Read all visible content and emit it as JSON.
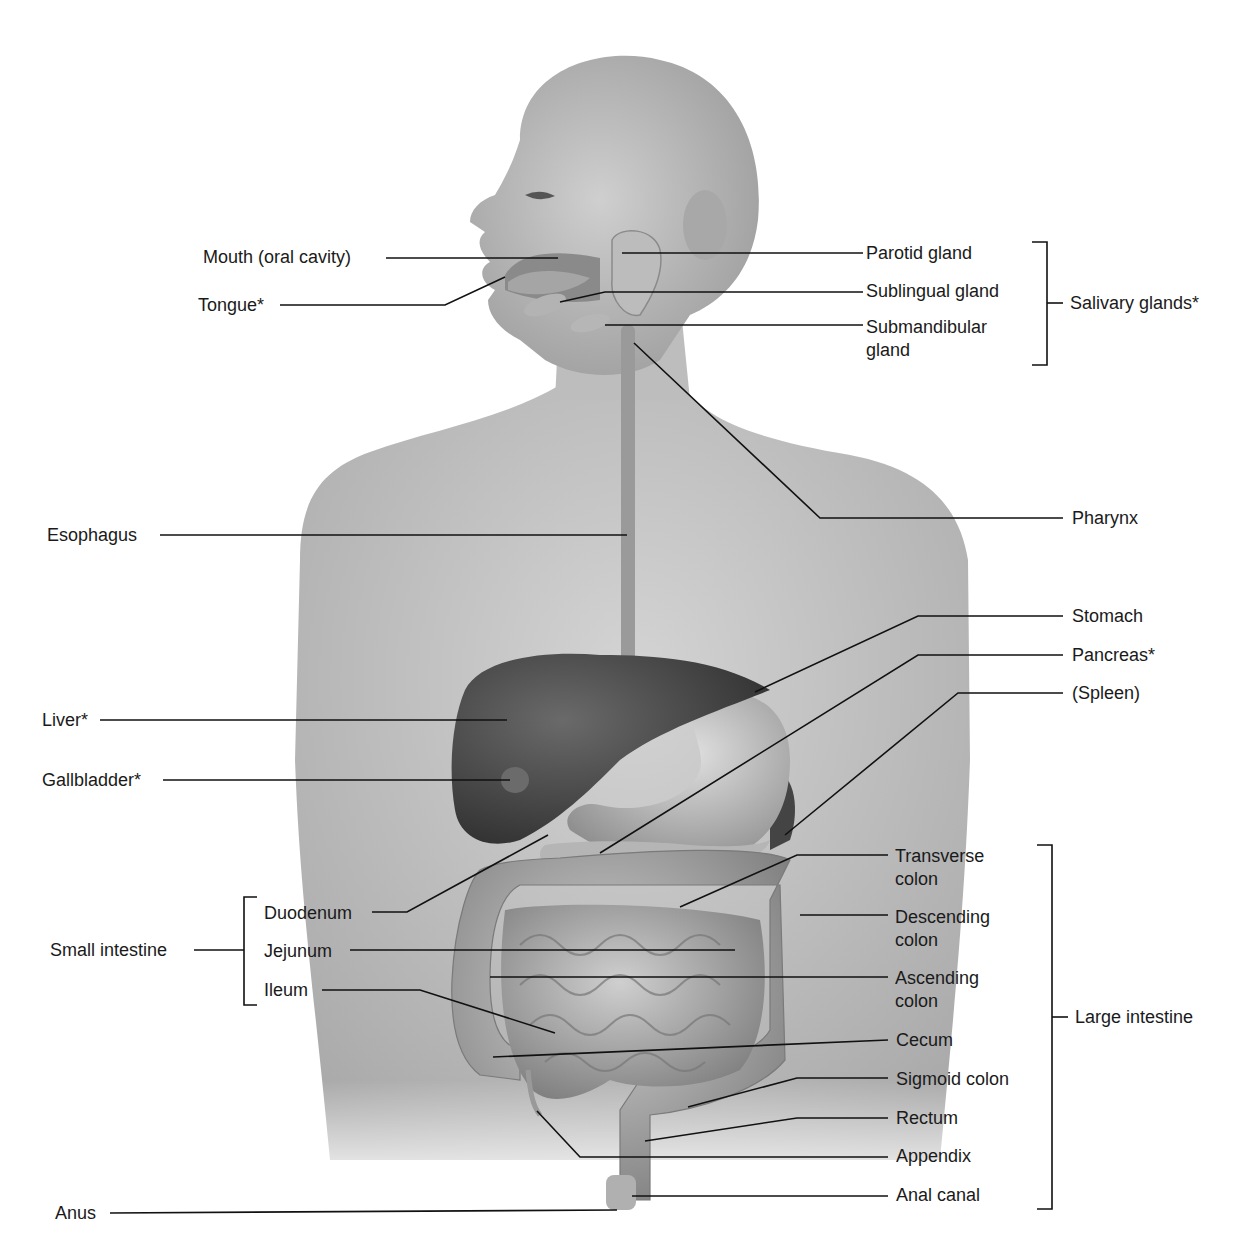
{
  "diagram": {
    "colors": {
      "label_text": "#1a1a1a",
      "leader_line": "#111111",
      "skin": "#c4c4c4",
      "organ_dark": "#4a4a4a",
      "organ_mid": "#9a9a9a",
      "organ_light": "#bdbdbd"
    },
    "labels_left": [
      {
        "id": "mouth",
        "text": "Mouth (oral cavity)"
      },
      {
        "id": "tongue",
        "text": "Tongue*"
      },
      {
        "id": "esophagus",
        "text": "Esophagus"
      },
      {
        "id": "liver",
        "text": "Liver*"
      },
      {
        "id": "gallbladder",
        "text": "Gallbladder*"
      },
      {
        "id": "small_intestine",
        "text": "Small intestine"
      },
      {
        "id": "duodenum",
        "text": "Duodenum"
      },
      {
        "id": "jejunum",
        "text": "Jejunum"
      },
      {
        "id": "ileum",
        "text": "Ileum"
      },
      {
        "id": "anus",
        "text": "Anus"
      }
    ],
    "labels_right": [
      {
        "id": "parotid",
        "text": "Parotid gland"
      },
      {
        "id": "sublingual",
        "text": "Sublingual gland"
      },
      {
        "id": "submandibular",
        "text": "Submandibular gland"
      },
      {
        "id": "salivary",
        "text": "Salivary glands*"
      },
      {
        "id": "pharynx",
        "text": "Pharynx"
      },
      {
        "id": "stomach",
        "text": "Stomach"
      },
      {
        "id": "pancreas",
        "text": "Pancreas*"
      },
      {
        "id": "spleen",
        "text": "(Spleen)"
      },
      {
        "id": "transverse",
        "text": "Transverse colon"
      },
      {
        "id": "descending",
        "text": "Descending colon"
      },
      {
        "id": "ascending",
        "text": "Ascending colon"
      },
      {
        "id": "large_intestine",
        "text": "Large intestine"
      },
      {
        "id": "cecum",
        "text": "Cecum"
      },
      {
        "id": "sigmoid",
        "text": "Sigmoid colon"
      },
      {
        "id": "rectum",
        "text": "Rectum"
      },
      {
        "id": "appendix",
        "text": "Appendix"
      },
      {
        "id": "anal_canal",
        "text": "Anal canal"
      }
    ],
    "groups": [
      {
        "id": "salivary",
        "label": "Salivary glands*",
        "members": [
          "Parotid gland",
          "Sublingual gland",
          "Submandibular gland"
        ]
      },
      {
        "id": "small_intestine",
        "label": "Small intestine",
        "members": [
          "Duodenum",
          "Jejunum",
          "Ileum"
        ]
      },
      {
        "id": "large_intestine",
        "label": "Large intestine",
        "members": [
          "Transverse colon",
          "Descending colon",
          "Ascending colon",
          "Cecum",
          "Sigmoid colon",
          "Rectum",
          "Appendix",
          "Anal canal"
        ]
      }
    ]
  }
}
